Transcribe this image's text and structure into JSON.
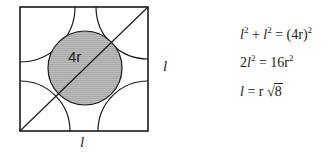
{
  "diagram": {
    "center_label": "4r",
    "side_label_right": "l",
    "side_label_bottom": "l",
    "colors": {
      "stroke": "#1a1a1a",
      "fill": "#b8b8b8"
    }
  },
  "equations": [
    {
      "lhs_a": "l",
      "exp_a": "2",
      "op": " + ",
      "lhs_b": "l",
      "exp_b": "2",
      "eq": " = (4r)",
      "exp_c": "2"
    },
    {
      "pre": "2",
      "var": "l",
      "exp_a": "2",
      "eq": " = 16r",
      "exp_b": "2"
    },
    {
      "var": "l",
      "eq": " = r ",
      "sqrt_sym": "√",
      "radicand": "8"
    }
  ]
}
